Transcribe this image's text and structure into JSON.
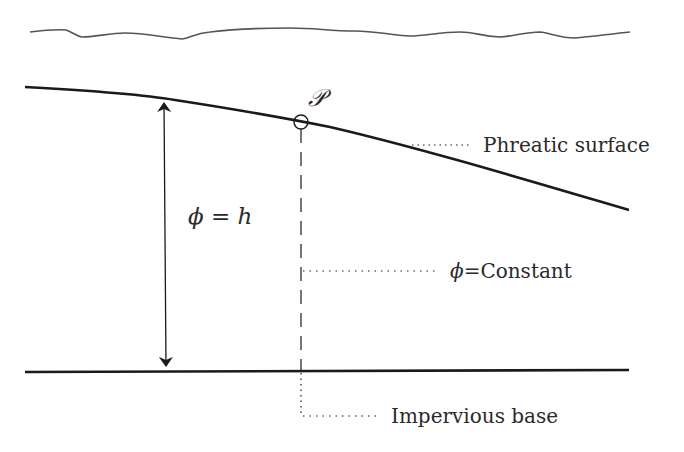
{
  "diagram": {
    "type": "groundwater-flow-schematic",
    "labels": {
      "point": "𝒫",
      "phreatic_surface": "Phreatic surface",
      "phi_h_phi": "ϕ",
      "phi_h_eq": " = ",
      "phi_h_h": "h",
      "phi_const_phi": "ϕ",
      "phi_const_rest": "=Constant",
      "impervious_base": "Impervious base"
    },
    "elements": {
      "ground_surface": "wavy line",
      "phreatic_surface": "thick sloping line",
      "head_arrow": "double-headed vertical arrow",
      "equipotential": "dashed vertical line through point",
      "impervious_base": "thick horizontal line"
    },
    "colors": {
      "line": "#1a1a1a",
      "wavy": "#555555",
      "text": "#2a2a2a"
    }
  }
}
